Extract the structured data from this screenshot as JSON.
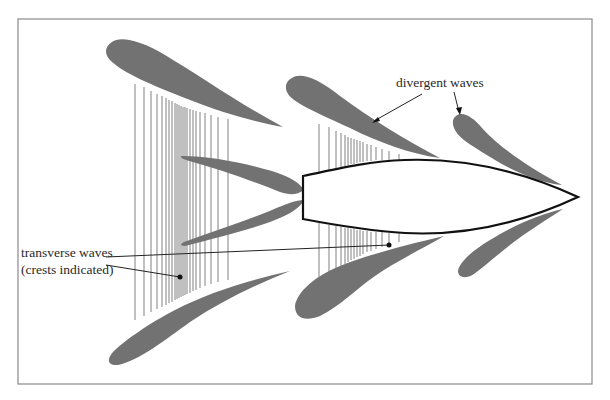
{
  "figure": {
    "colors": {
      "frame": "#8a8a8a",
      "wave_fill": "#727272",
      "hull_stroke": "#111111",
      "text": "#2a2a2a"
    }
  },
  "labels": {
    "divergent": "divergent waves",
    "transverse_line1": "transverse waves",
    "transverse_line2": "(crests indicated)"
  },
  "elements": {
    "hull": "ship-hull",
    "divergent_wave_count": 6,
    "transverse_wave_groups": 2
  }
}
